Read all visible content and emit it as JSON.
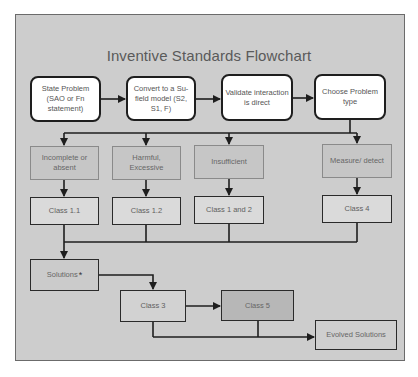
{
  "diagram": {
    "title": "Inventive Standards Flowchart",
    "steps": [
      {
        "id": "state-problem",
        "label": "State Problem (SAO or Fn statement)"
      },
      {
        "id": "convert-model",
        "label": "Convert to a Su-field model (S2, S1, F)"
      },
      {
        "id": "validate",
        "label": "Validate interaction is direct"
      },
      {
        "id": "choose-type",
        "label": "Choose Problem type"
      }
    ],
    "problem_types": [
      {
        "label": "Incomplete or absent",
        "class_label": "Class 1.1"
      },
      {
        "label": "Harmful, Excessive",
        "class_label": "Class 1.2"
      },
      {
        "label": "Insufficient",
        "class_label": "Class 1 and 2"
      },
      {
        "label": "Measure/ detect",
        "class_label": "Class 4"
      }
    ],
    "solutions": {
      "label": "Solutions",
      "marker": "*"
    },
    "class3": "Class 3",
    "class5": "Class 5",
    "evolved": "Evolved Solutions"
  },
  "colors": {
    "frame_bg": "#cdcdcd",
    "frame_border": "#6b6b6b",
    "rounded_fill": "#ffffff",
    "category_fill": "#c6c6c6",
    "class_fill": "#dadada",
    "class5_fill": "#b7b7b7",
    "line": "#1e1e1e"
  }
}
